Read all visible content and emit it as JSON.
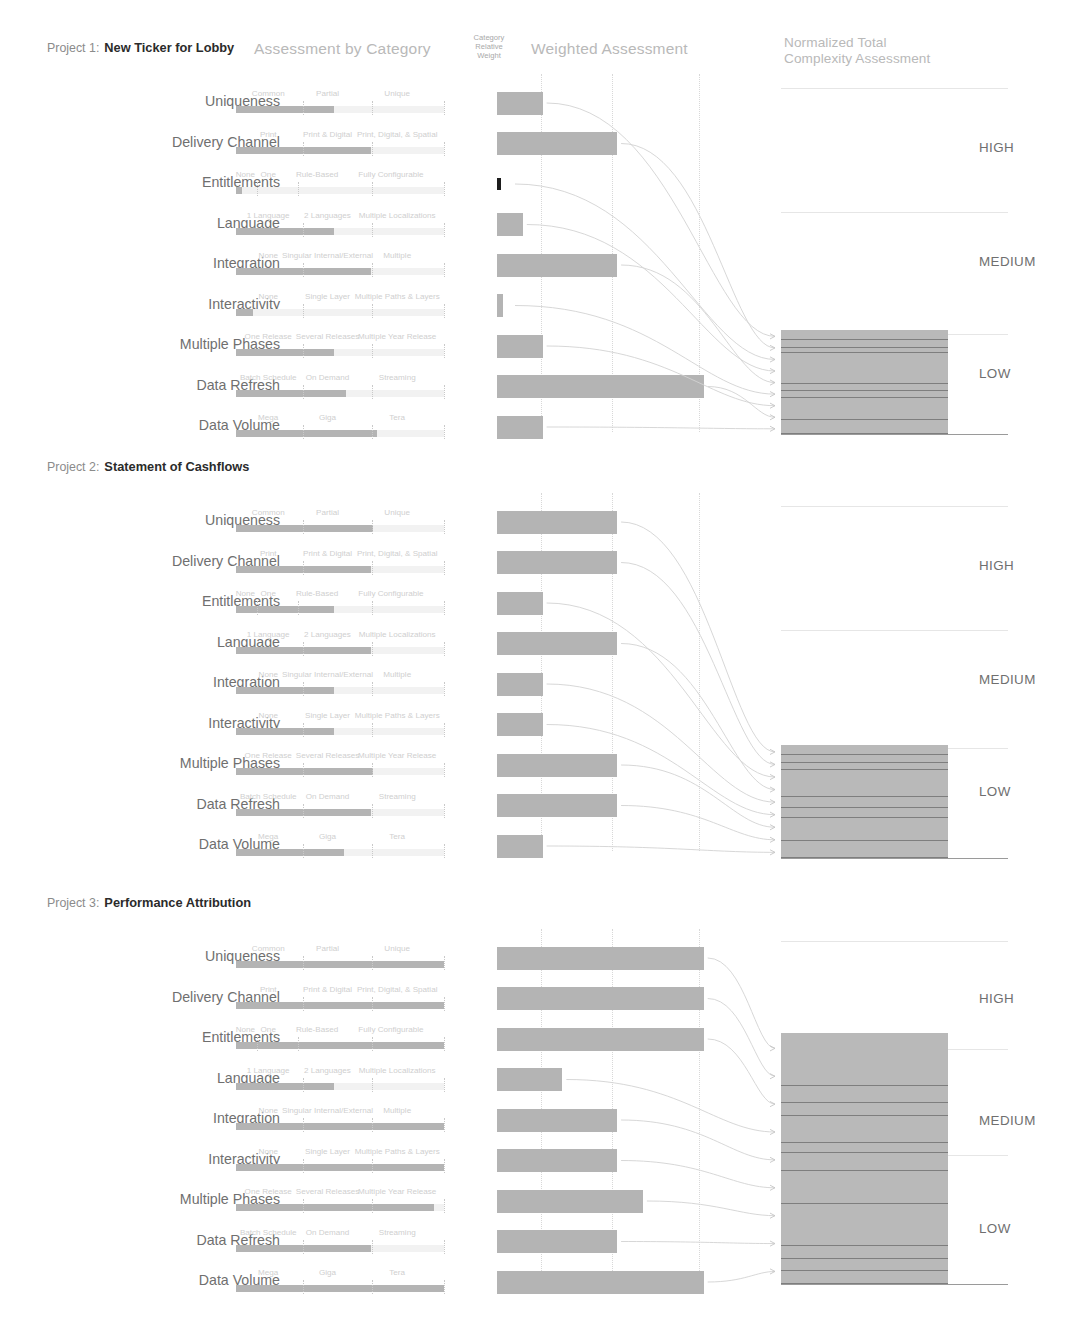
{
  "headers": {
    "assessment_by_category": "Assessment by Category",
    "category_relative_weight": "Category\nRelative\nWeight",
    "category_relative_weight_l1": "Category",
    "category_relative_weight_l2": "Relative",
    "category_relative_weight_l3": "Weight",
    "weighted_assessment": "Weighted Assessment",
    "normalized_total_l1": "Normalized Total",
    "normalized_total_l2": "Complexity Assessment"
  },
  "bands": {
    "high": "HIGH",
    "medium": "MEDIUM",
    "low": "LOW"
  },
  "colors": {
    "bar_fill": "#b4b4b4",
    "track": "#f2f2f2",
    "weight_mark": "#1d1d1d",
    "text": "#6f6f6f",
    "muted_text": "#cfcfcf",
    "title_strong": "#2b2b2b",
    "gridline": "#d8d8d8"
  },
  "categories": [
    {
      "name": "Uniqueness",
      "scale": [
        "Common",
        "Partial",
        "Unique"
      ]
    },
    {
      "name": "Delivery Channel",
      "scale": [
        "Print",
        "Print & Digital",
        "Print, Digital, & Spatial"
      ]
    },
    {
      "name": "Entitlements",
      "scale": [
        "None",
        "One",
        "Rule-Based",
        "Fully Configurable"
      ]
    },
    {
      "name": "Language",
      "scale": [
        "1 Language",
        "2 Languages",
        "Multiple Localizations"
      ]
    },
    {
      "name": "Integration",
      "scale": [
        "None",
        "Singular Internal/External",
        "Multiple"
      ]
    },
    {
      "name": "Interactivity",
      "scale": [
        "None",
        "Single Layer",
        "Multiple Paths & Layers"
      ]
    },
    {
      "name": "Multiple Phases",
      "scale": [
        "One Release",
        "Several Releases",
        "Multiple Year Release"
      ]
    },
    {
      "name": "Data Refresh",
      "scale": [
        "Batch Schedule",
        "On Demand",
        "Streaming"
      ]
    },
    {
      "name": "Data Volume",
      "scale": [
        "Mega",
        "Giga",
        "Tera"
      ]
    }
  ],
  "projects": [
    {
      "number_label": "Project 1:",
      "name": "New Ticker for Lobby",
      "total_band": "LOW",
      "rows": [
        {
          "assessment_pct": 47,
          "weight_pct": 32,
          "weighted_pct": 30
        },
        {
          "assessment_pct": 65,
          "weight_pct": 14,
          "weighted_pct": 79
        },
        {
          "assessment_pct": 3,
          "weight_pct": 31,
          "weighted_pct": 0
        },
        {
          "assessment_pct": 47,
          "weight_pct": 16,
          "weighted_pct": 17
        },
        {
          "assessment_pct": 65,
          "weight_pct": 35,
          "weighted_pct": 79
        },
        {
          "assessment_pct": 8,
          "weight_pct": 60,
          "weighted_pct": 4
        },
        {
          "assessment_pct": 47,
          "weight_pct": 14,
          "weighted_pct": 30
        },
        {
          "assessment_pct": 53,
          "weight_pct": 16,
          "weighted_pct": 136
        },
        {
          "assessment_pct": 68,
          "weight_pct": 16,
          "weighted_pct": 30
        }
      ]
    },
    {
      "number_label": "Project 2:",
      "name": "Statement of Cashflows",
      "total_band": "LOW",
      "rows": [
        {
          "assessment_pct": 66,
          "weight_pct": 45,
          "weighted_pct": 79
        },
        {
          "assessment_pct": 65,
          "weight_pct": 16,
          "weighted_pct": 79
        },
        {
          "assessment_pct": 47,
          "weight_pct": 32,
          "weighted_pct": 30
        },
        {
          "assessment_pct": 65,
          "weight_pct": 16,
          "weighted_pct": 79
        },
        {
          "assessment_pct": 47,
          "weight_pct": 32,
          "weighted_pct": 30
        },
        {
          "assessment_pct": 47,
          "weight_pct": 50,
          "weighted_pct": 30
        },
        {
          "assessment_pct": 66,
          "weight_pct": 16,
          "weighted_pct": 79
        },
        {
          "assessment_pct": 65,
          "weight_pct": 16,
          "weighted_pct": 79
        },
        {
          "assessment_pct": 52,
          "weight_pct": 16,
          "weighted_pct": 30
        }
      ]
    },
    {
      "number_label": "Project 3:",
      "name": "Performance Attribution",
      "total_band": "MEDIUM",
      "rows": [
        {
          "assessment_pct": 100,
          "weight_pct": 36,
          "weighted_pct": 136
        },
        {
          "assessment_pct": 100,
          "weight_pct": 16,
          "weighted_pct": 136
        },
        {
          "assessment_pct": 100,
          "weight_pct": 32,
          "weighted_pct": 136
        },
        {
          "assessment_pct": 47,
          "weight_pct": 16,
          "weighted_pct": 43
        },
        {
          "assessment_pct": 100,
          "weight_pct": 32,
          "weighted_pct": 79
        },
        {
          "assessment_pct": 100,
          "weight_pct": 50,
          "weighted_pct": 79
        },
        {
          "assessment_pct": 95,
          "weight_pct": 16,
          "weighted_pct": 96
        },
        {
          "assessment_pct": 65,
          "weight_pct": 16,
          "weighted_pct": 79
        },
        {
          "assessment_pct": 100,
          "weight_pct": 16,
          "weighted_pct": 136
        }
      ]
    }
  ]
}
